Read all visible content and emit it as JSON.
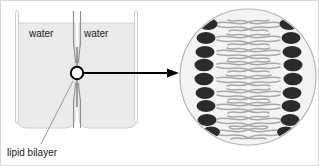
{
  "figure": {
    "background_color": "#ffffff",
    "border_color": "#d8d8d8",
    "width": 319,
    "height": 166
  },
  "apparatus": {
    "name": "two-chamber water bath with dividing partition",
    "chamber_fill_color": "#ebebeb",
    "chamber_outline_color": "#c9c9c9",
    "wall_color": "#cfcfcf",
    "divider_color": "#8a8a8a",
    "left_chamber": {
      "label": "water"
    },
    "right_chamber": {
      "label": "water"
    },
    "aperture": {
      "label": "lipid bilayer",
      "marker_shape": "circle",
      "marker_color": "#000000"
    }
  },
  "callout": {
    "caption": "lipid bilayer",
    "leader_line_color": "#9a9a9a",
    "arrow_color": "#000000",
    "arrow_direction": "right"
  },
  "magnified_view": {
    "name": "magnified lipid bilayer cross-section",
    "circle_fill_color": "#f4f4f4",
    "circle_outline_color": "#b5b5b5",
    "center_x": 247,
    "center_y": 76,
    "radius": 68,
    "head_color": "#2b2b2b",
    "tail_color": "#a8a8a8",
    "leaflets": [
      {
        "name": "left leaflet",
        "orientation": "heads-face-left",
        "head_count": 9,
        "head_y_positions": [
          23,
          37,
          51,
          64,
          78,
          92,
          105,
          119,
          131
        ],
        "head_x": 207
      },
      {
        "name": "right leaflet",
        "orientation": "heads-face-right",
        "head_count": 9,
        "head_y_positions": [
          23,
          37,
          51,
          64,
          78,
          92,
          105,
          119,
          131
        ],
        "head_x": 288
      }
    ]
  }
}
